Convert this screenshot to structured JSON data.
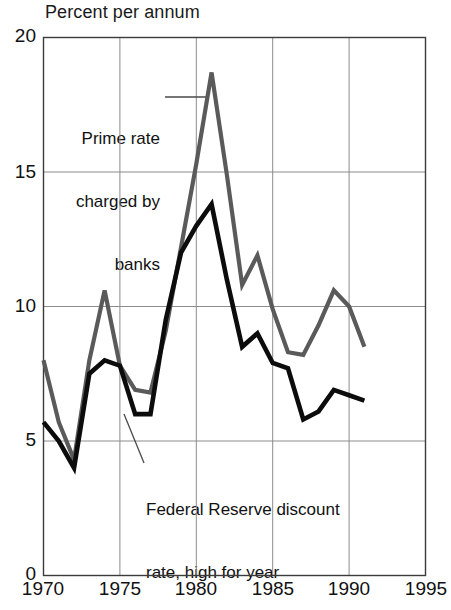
{
  "chart_data": {
    "type": "line",
    "title": "Percent per annum",
    "xlabel": "",
    "ylabel": "",
    "xlim": [
      1970,
      1995
    ],
    "ylim": [
      0,
      20
    ],
    "xticks": [
      "1970",
      "1975",
      "1980",
      "1985",
      "1990",
      "1995"
    ],
    "yticks": [
      "0",
      "5",
      "10",
      "15",
      "20"
    ],
    "grid": true,
    "legend_position": "annotations-inline",
    "annotations": [
      {
        "id": "prime-rate",
        "text": "Prime rate\ncharged by\nbanks",
        "lines": [
          "Prime rate",
          "charged by",
          "banks"
        ],
        "align": "right",
        "leader": "line to gray series at 1981 peak"
      },
      {
        "id": "discount-rate",
        "text": "Federal Reserve discount\nrate, high for year",
        "lines": [
          "Federal Reserve discount",
          "rate, high for year"
        ],
        "align": "left",
        "leader": "line to black series near 1977"
      }
    ],
    "series": [
      {
        "name": "Prime rate charged by banks",
        "color": "#5a5a5a",
        "x": [
          1970,
          1971,
          1972,
          1973,
          1974,
          1975,
          1976,
          1977,
          1978,
          1979,
          1980,
          1981,
          1982,
          1983,
          1984,
          1985,
          1986,
          1987,
          1988,
          1989,
          1990,
          1991
        ],
        "values": [
          8.0,
          5.7,
          4.3,
          8.0,
          10.6,
          7.8,
          6.9,
          6.8,
          9.1,
          12.2,
          15.3,
          18.7,
          14.9,
          10.8,
          11.9,
          9.9,
          8.3,
          8.2,
          9.3,
          10.6,
          10.0,
          8.5
        ]
      },
      {
        "name": "Federal Reserve discount rate, high for year",
        "color": "#0c0c0c",
        "x": [
          1970,
          1971,
          1972,
          1973,
          1974,
          1975,
          1976,
          1977,
          1978,
          1979,
          1980,
          1981,
          1982,
          1983,
          1984,
          1985,
          1986,
          1987,
          1988,
          1989,
          1990,
          1991
        ],
        "values": [
          5.7,
          5.0,
          4.0,
          7.5,
          8.0,
          7.8,
          6.0,
          6.0,
          9.5,
          12.0,
          13.0,
          13.8,
          11.0,
          8.5,
          9.0,
          7.9,
          7.7,
          5.8,
          6.1,
          6.9,
          6.7,
          6.5
        ]
      }
    ]
  }
}
